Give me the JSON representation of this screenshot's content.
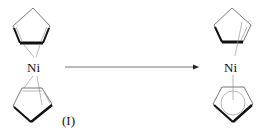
{
  "diagram": {
    "reactant": {
      "metal_label": "Ni",
      "compound_label": "(I)"
    },
    "product": {
      "metal_label": "Ni"
    },
    "arrow": {
      "direction": "right"
    },
    "colors": {
      "line": "#555555",
      "bold": "#111111",
      "background": "#ffffff"
    }
  }
}
